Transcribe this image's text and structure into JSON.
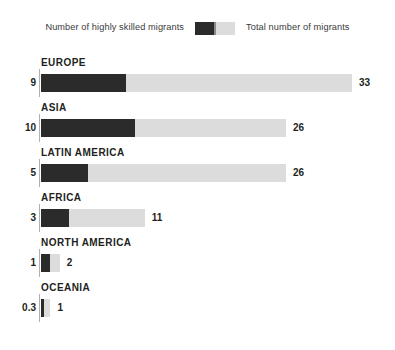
{
  "legend": {
    "skilled_label": "Number of highly skilled migrants",
    "total_label": "Total number of migrants",
    "skilled_color": "#2b2b2b",
    "total_color": "#dcdcdc"
  },
  "chart_data": {
    "type": "bar",
    "orientation": "horizontal",
    "stacked": true,
    "title": "",
    "subtitle": "",
    "xlabel": "",
    "ylabel": "",
    "grid": false,
    "legend_position": "top",
    "xlim": [
      0,
      33
    ],
    "categories": [
      "EUROPE",
      "ASIA",
      "LATIN AMERICA",
      "AFRICA",
      "NORTH AMERICA",
      "OCEANIA"
    ],
    "series": [
      {
        "name": "Number of highly skilled migrants",
        "color": "#2b2b2b",
        "values": [
          9,
          10,
          5,
          3,
          1,
          0.3
        ],
        "labels": [
          "9",
          "10",
          "5",
          "3",
          "1",
          "0.3"
        ]
      },
      {
        "name": "Total number of migrants",
        "color": "#dcdcdc",
        "values": [
          33,
          26,
          26,
          11,
          2,
          1
        ],
        "labels": [
          "33",
          "26",
          "26",
          "11",
          "2",
          "1"
        ]
      }
    ]
  },
  "rows": [
    {
      "region": "EUROPE",
      "skilled": 9,
      "skilled_label": "9",
      "total": 33,
      "total_label": "33"
    },
    {
      "region": "ASIA",
      "skilled": 10,
      "skilled_label": "10",
      "total": 26,
      "total_label": "26"
    },
    {
      "region": "LATIN AMERICA",
      "skilled": 5,
      "skilled_label": "5",
      "total": 26,
      "total_label": "26"
    },
    {
      "region": "AFRICA",
      "skilled": 3,
      "skilled_label": "3",
      "total": 11,
      "total_label": "11"
    },
    {
      "region": "NORTH AMERICA",
      "skilled": 1,
      "skilled_label": "1",
      "total": 2,
      "total_label": "2"
    },
    {
      "region": "OCEANIA",
      "skilled": 0.3,
      "skilled_label": "0.3",
      "total": 1,
      "total_label": "1"
    }
  ]
}
